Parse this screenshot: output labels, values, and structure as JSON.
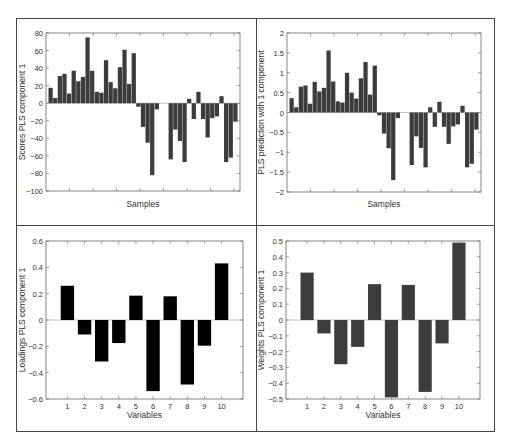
{
  "chart_data": [
    {
      "id": "scores",
      "type": "bar",
      "title": "",
      "xlabel": "Samples",
      "ylabel": "Scores PLS component 1",
      "ylim": [
        -100,
        80
      ],
      "yticks": [
        80,
        60,
        40,
        20,
        0,
        -20,
        -40,
        -60,
        -80,
        -100
      ],
      "ytick_labels": [
        "80",
        "60",
        "40",
        "20",
        "0",
        "−20",
        "−40",
        "−60",
        "−80",
        "−100"
      ],
      "xtick_labels": [],
      "grid": false,
      "bar_color": "#3c3c3c",
      "categories": [
        1,
        2,
        3,
        4,
        5,
        6,
        7,
        8,
        9,
        10,
        11,
        12,
        13,
        14,
        15,
        16,
        17,
        18,
        19,
        20,
        21,
        22,
        23,
        24,
        25,
        26,
        27,
        28,
        29,
        30,
        31,
        32,
        33,
        34,
        35,
        36,
        37,
        38,
        39,
        40,
        41
      ],
      "values": [
        17.5,
        6,
        31,
        33.5,
        11,
        37,
        25,
        30,
        75,
        37,
        13,
        12,
        49,
        24,
        17,
        41,
        61,
        22,
        57,
        -4,
        -27,
        -45,
        -82,
        -7,
        0,
        0,
        -64,
        -30,
        -43,
        -67,
        5,
        -18,
        13,
        -18,
        -39,
        -17,
        -15,
        8,
        -67,
        -62,
        -21
      ]
    },
    {
      "id": "prediction",
      "type": "bar",
      "title": "",
      "xlabel": "Samples",
      "ylabel": "PLS prediction with 1 component",
      "ylim": [
        -2,
        2
      ],
      "yticks": [
        2,
        1.5,
        1,
        0.5,
        0,
        -0.5,
        -1,
        -1.5,
        -2
      ],
      "ytick_labels": [
        "2",
        "1.5",
        "1",
        "0.5",
        "0",
        "−0.5",
        "−1",
        "−1.5",
        "−2"
      ],
      "xtick_labels": [],
      "grid": false,
      "bar_color": "#3c3c3c",
      "categories": [
        1,
        2,
        3,
        4,
        5,
        6,
        7,
        8,
        9,
        10,
        11,
        12,
        13,
        14,
        15,
        16,
        17,
        18,
        19,
        20,
        21,
        22,
        23,
        24,
        25,
        26,
        27,
        28,
        29,
        30,
        31,
        32,
        33,
        34,
        35,
        36,
        37,
        38,
        39,
        40,
        41
      ],
      "values": [
        0.36,
        0.13,
        0.65,
        0.68,
        0.22,
        0.77,
        0.53,
        0.62,
        1.56,
        0.78,
        0.28,
        0.25,
        1.0,
        0.5,
        0.35,
        0.86,
        1.27,
        0.45,
        1.18,
        -0.07,
        -0.53,
        -0.9,
        -1.7,
        -0.14,
        0,
        0,
        -1.32,
        -0.6,
        -0.89,
        -1.38,
        0.13,
        -0.36,
        0.27,
        -0.36,
        -0.79,
        -0.35,
        -0.3,
        0.17,
        -1.38,
        -1.29,
        -0.43
      ]
    },
    {
      "id": "loadings",
      "type": "bar",
      "title": "",
      "xlabel": "Variables",
      "ylabel": "Loadings PLS component 1",
      "ylim": [
        -0.6,
        0.6
      ],
      "yticks": [
        0.6,
        0.4,
        0.2,
        0,
        -0.2,
        -0.4,
        -0.6
      ],
      "ytick_labels": [
        "0.6",
        "0.4",
        "0.2",
        "0",
        "−0.2",
        "−0.4",
        "−0.6"
      ],
      "xtick_labels": [
        "1",
        "2",
        "3",
        "4",
        "5",
        "6",
        "7",
        "8",
        "9",
        "10"
      ],
      "grid": false,
      "bar_color": "#000000",
      "categories": [
        1,
        2,
        3,
        4,
        5,
        6,
        7,
        8,
        9,
        10
      ],
      "values": [
        0.26,
        -0.11,
        -0.315,
        -0.175,
        0.185,
        -0.54,
        0.18,
        -0.49,
        -0.195,
        0.43
      ]
    },
    {
      "id": "weights",
      "type": "bar",
      "title": "",
      "xlabel": "Variables",
      "ylabel": "Weights PLS component 1",
      "ylim": [
        -0.5,
        0.5
      ],
      "yticks": [
        0.5,
        0.4,
        0.3,
        0.2,
        0.1,
        0,
        -0.1,
        -0.2,
        -0.3,
        -0.4,
        -0.5
      ],
      "ytick_labels": [
        "0.5",
        "0.4",
        "0.3",
        "0.2",
        "0.1",
        "0",
        "−0.1",
        "−0.2",
        "−0.3",
        "−0.4",
        "−0.5"
      ],
      "xtick_labels": [
        "1",
        "2",
        "3",
        "4",
        "5",
        "6",
        "7",
        "8",
        "9",
        "10"
      ],
      "grid": false,
      "bar_color": "#3c3c3c",
      "categories": [
        1,
        2,
        3,
        4,
        5,
        6,
        7,
        8,
        9,
        10
      ],
      "values": [
        0.3,
        -0.085,
        -0.28,
        -0.17,
        0.227,
        -0.49,
        0.222,
        -0.455,
        -0.148,
        0.49
      ]
    }
  ]
}
